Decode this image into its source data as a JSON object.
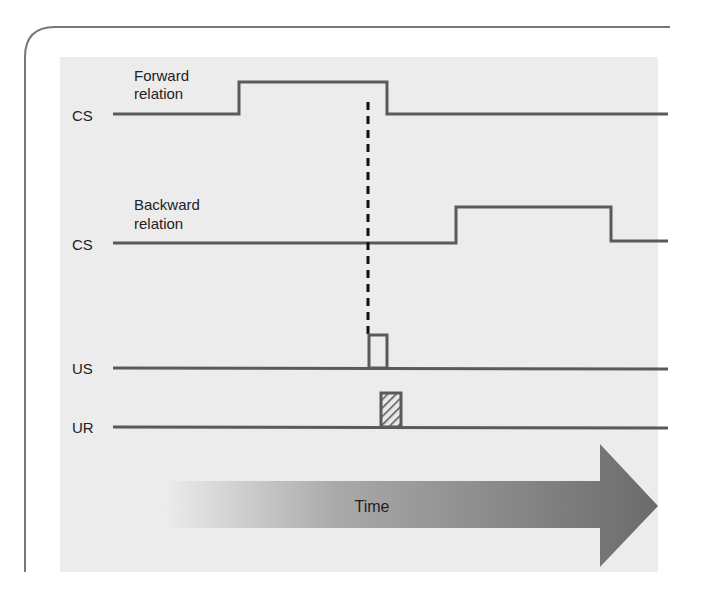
{
  "diagram": {
    "colors": {
      "background": "#ffffff",
      "panel": "#ececec",
      "frame": "#777777",
      "trace": "#5a5a5a",
      "dashed": "#111111",
      "arrow_start": "#ececec",
      "arrow_end": "#6e6e6e",
      "text": "#222222"
    },
    "rows": [
      {
        "id": "cs-forward",
        "label": "CS",
        "caption_line1": "Forward",
        "caption_line2": "relation"
      },
      {
        "id": "cs-backward",
        "label": "CS",
        "caption_line1": "Backward",
        "caption_line2": "relation"
      },
      {
        "id": "us",
        "label": "US",
        "pulse_style": "open"
      },
      {
        "id": "ur",
        "label": "UR",
        "pulse_style": "hatched"
      }
    ],
    "time_arrow": {
      "label": "Time"
    }
  }
}
